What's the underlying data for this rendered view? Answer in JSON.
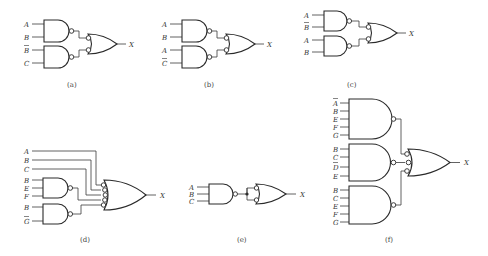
{
  "figure": {
    "panels": [
      {
        "id": "a",
        "caption": "(a)",
        "output": "X",
        "gates": [
          {
            "type": "NAND",
            "inputs": [
              "A",
              "B"
            ]
          },
          {
            "type": "NAND",
            "inputs": [
              "B̄",
              "C"
            ]
          }
        ],
        "final": {
          "type": "OR",
          "inverted_inputs": 2
        }
      },
      {
        "id": "b",
        "caption": "(b)",
        "output": "X",
        "gates": [
          {
            "type": "NAND",
            "inputs": [
              "A",
              "B"
            ]
          },
          {
            "type": "NAND",
            "inputs": [
              "A",
              "C̄"
            ]
          }
        ],
        "final": {
          "type": "OR",
          "inverted_inputs": 2
        }
      },
      {
        "id": "c",
        "caption": "(c)",
        "output": "X",
        "gates": [
          {
            "type": "NAND",
            "inputs": [
              "A",
              "B̄"
            ]
          },
          {
            "type": "NAND",
            "inputs": [
              "A",
              "B"
            ]
          }
        ],
        "final": {
          "type": "OR",
          "inverted_inputs": 2
        }
      },
      {
        "id": "d",
        "caption": "(d)",
        "output": "X",
        "direct_inputs": [
          "A",
          "B",
          "C"
        ],
        "gates": [
          {
            "type": "NAND",
            "inputs": [
              "B",
              "E",
              "F"
            ]
          },
          {
            "type": "NAND",
            "inputs": [
              "B",
              "Ḡ"
            ]
          }
        ],
        "final": {
          "type": "OR",
          "inverted_inputs": 5
        }
      },
      {
        "id": "e",
        "caption": "(e)",
        "output": "X",
        "gates": [
          {
            "type": "NAND",
            "inputs": [
              "A",
              "B",
              "C"
            ]
          }
        ],
        "final": {
          "type": "OR",
          "inverted_inputs": 2,
          "tied_inputs": true
        }
      },
      {
        "id": "f",
        "caption": "(f)",
        "output": "X",
        "gates": [
          {
            "type": "NAND",
            "inputs": [
              "Ā",
              "B",
              "E",
              "F",
              "G"
            ]
          },
          {
            "type": "NAND",
            "inputs": [
              "B",
              "C",
              "D̄",
              "E"
            ]
          },
          {
            "type": "NAND",
            "inputs": [
              "B",
              "C",
              "E",
              "F",
              "G"
            ]
          }
        ],
        "final": {
          "type": "OR",
          "inverted_inputs": 3
        }
      }
    ]
  },
  "labels": {
    "a": {
      "in": [
        "A",
        "B",
        "B",
        "C"
      ],
      "bar": [
        false,
        false,
        true,
        false
      ],
      "out": "X",
      "cap": "(a)"
    },
    "b": {
      "in": [
        "A",
        "B",
        "A",
        "C"
      ],
      "bar": [
        false,
        false,
        false,
        true
      ],
      "out": "X",
      "cap": "(b)"
    },
    "c": {
      "in": [
        "A",
        "B",
        "A",
        "B"
      ],
      "bar": [
        false,
        true,
        false,
        false
      ],
      "out": "X",
      "cap": "(c)"
    },
    "d": {
      "in": [
        "A",
        "B",
        "C",
        "B",
        "E",
        "F",
        "B",
        "G"
      ],
      "bar": [
        false,
        false,
        false,
        false,
        false,
        false,
        false,
        true
      ],
      "out": "X",
      "cap": "(d)"
    },
    "e": {
      "in": [
        "A",
        "B",
        "C"
      ],
      "out": "X",
      "cap": "(e)"
    },
    "f": {
      "in": [
        "A",
        "B",
        "E",
        "F",
        "G",
        "B",
        "C",
        "D",
        "E",
        "B",
        "C",
        "E",
        "F",
        "G"
      ],
      "bar": [
        true,
        false,
        false,
        false,
        false,
        false,
        false,
        true,
        false,
        false,
        false,
        false,
        false,
        false
      ],
      "out": "X",
      "cap": "(f)"
    }
  }
}
